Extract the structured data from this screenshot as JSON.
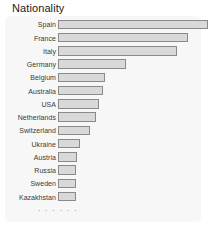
{
  "chart_data": {
    "type": "bar",
    "orientation": "horizontal",
    "title": "Nationality",
    "xlabel": "",
    "ylabel": "",
    "grid": false,
    "legend": null,
    "truncated_indicator": "· · ·",
    "categories": [
      "Spain",
      "France",
      "Italy",
      "Germany",
      "Belgium",
      "Australia",
      "USA",
      "Netherlands",
      "Switzerland",
      "Ukraine",
      "Austria",
      "Russia",
      "Sweden",
      "Kazakhstan"
    ],
    "values": [
      103,
      89,
      82,
      47,
      32,
      31,
      28,
      26,
      22,
      15,
      13,
      12,
      12,
      12
    ],
    "xlim": [
      0,
      103
    ],
    "bars": [
      {
        "label": "Spain",
        "value": 103,
        "width_pct": 100.0
      },
      {
        "label": "France",
        "value": 89,
        "width_pct": 86.4
      },
      {
        "label": "Italy",
        "value": 82,
        "width_pct": 79.6
      },
      {
        "label": "Germany",
        "value": 47,
        "width_pct": 45.6
      },
      {
        "label": "Belgium",
        "value": 32,
        "width_pct": 31.1
      },
      {
        "label": "Australia",
        "value": 31,
        "width_pct": 30.1
      },
      {
        "label": "USA",
        "value": 28,
        "width_pct": 27.2
      },
      {
        "label": "Netherlands",
        "value": 26,
        "width_pct": 25.2
      },
      {
        "label": "Switzerland",
        "value": 22,
        "width_pct": 21.4
      },
      {
        "label": "Ukraine",
        "value": 15,
        "width_pct": 14.6
      },
      {
        "label": "Austria",
        "value": 13,
        "width_pct": 12.6
      },
      {
        "label": "Russia",
        "value": 12,
        "width_pct": 11.7
      },
      {
        "label": "Sweden",
        "value": 12,
        "width_pct": 11.7
      },
      {
        "label": "Kazakhstan",
        "value": 12,
        "width_pct": 11.7
      }
    ]
  },
  "style": {
    "bar_fill": "#d9d9d9",
    "bar_border": "#8a8a8a",
    "panel_background": "#f7f7f7",
    "page_background": "#ffffff",
    "title_color": "#1a1a1a",
    "label_color": "#3a3a3a"
  }
}
